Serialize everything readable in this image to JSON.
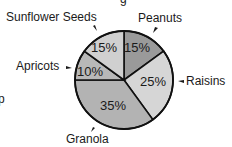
{
  "chart_data": {
    "type": "pie",
    "title": "",
    "slices": [
      {
        "label": "Peanuts",
        "value": 15,
        "display": "15%",
        "color": "#9a9a9a"
      },
      {
        "label": "Raisins",
        "value": 25,
        "display": "25%",
        "color": "#d6d6d6"
      },
      {
        "label": "Granola",
        "value": 35,
        "display": "35%",
        "color": "#b3b3b3"
      },
      {
        "label": "Apricots",
        "value": 10,
        "display": "10%",
        "color": "#b8b8b8"
      },
      {
        "label": "Sunflower Seeds",
        "value": 15,
        "display": "15%",
        "color": "#d0d0d0"
      }
    ],
    "legend": "callout labels with arrows",
    "start_angle_deg": 0,
    "direction": "clockwise"
  },
  "labels": {
    "peanuts": "Peanuts",
    "raisins": "Raisins",
    "granola": "Granola",
    "apricots": "Apricots",
    "sunflower": "Sunflower Seeds",
    "pct_peanuts": "15%",
    "pct_raisins": "25%",
    "pct_granola": "35%",
    "pct_apricots": "10%",
    "pct_sunflower": "15%"
  }
}
